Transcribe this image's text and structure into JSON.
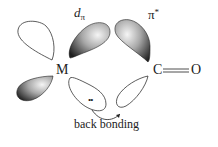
{
  "diagram": {
    "labels": {
      "d_pi_main": "d",
      "d_pi_sub": "π",
      "pi_star_main": "π",
      "pi_star_sup": "*",
      "metal": "M",
      "carbon": "C",
      "oxygen": "O",
      "caption": "back bonding"
    },
    "lone_pair": "••",
    "colors": {
      "shaded_lobe_dark": "#1e1e1e",
      "shaded_lobe_light": "#f2f2f2",
      "outline": "#333333",
      "text": "#222222",
      "background": "#ffffff"
    },
    "orbitals": [
      {
        "name": "metal-d-upper-left-lobe",
        "shaded": false
      },
      {
        "name": "metal-d-upper-right-lobe",
        "shaded": true
      },
      {
        "name": "metal-d-lower-left-lobe",
        "shaded": true
      },
      {
        "name": "metal-d-lower-right-lobe",
        "shaded": false
      },
      {
        "name": "co-pi-star-upper-lobe",
        "shaded": true
      },
      {
        "name": "co-pi-star-lower-lobe",
        "shaded": false
      }
    ],
    "bond": {
      "from": "C",
      "to": "O",
      "order": 2
    }
  }
}
